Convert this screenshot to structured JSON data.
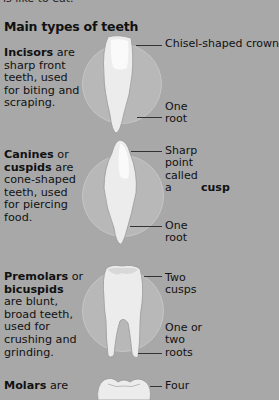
{
  "top_partial_text": "is like to eat.",
  "title": "Main types of teeth",
  "sections": [
    {
      "name_bold": "Incisors",
      "desc_rest": " are sharp front teeth, used for biting and scraping.",
      "labels": [
        {
          "text": "Chisel-shaped crown"
        },
        {
          "text": "One root"
        }
      ]
    },
    {
      "name_bold": "Canines",
      "desc_mid": " or ",
      "alt_bold": "cuspids",
      "desc_rest": " are cone-shaped teeth, used for piercing food.",
      "labels": [
        {
          "text_pre": "Sharp point called a ",
          "text_bold": "cusp"
        },
        {
          "text": "One root"
        }
      ]
    },
    {
      "name_bold": "Premolars",
      "desc_mid": " or ",
      "alt_bold": "bicuspids",
      "desc_rest": " are blunt, broad teeth, used for crushing and grinding.",
      "labels": [
        {
          "text": "Two cusps"
        },
        {
          "text": "One or two roots"
        }
      ]
    },
    {
      "name_bold": "Molars",
      "desc_rest": " are",
      "labels": [
        {
          "text": "Four"
        }
      ]
    }
  ],
  "colors": {
    "background": "#a8a8a8",
    "circle": "#b8b8b8",
    "tooth": "#f2f2f2",
    "leader": "#333333"
  }
}
